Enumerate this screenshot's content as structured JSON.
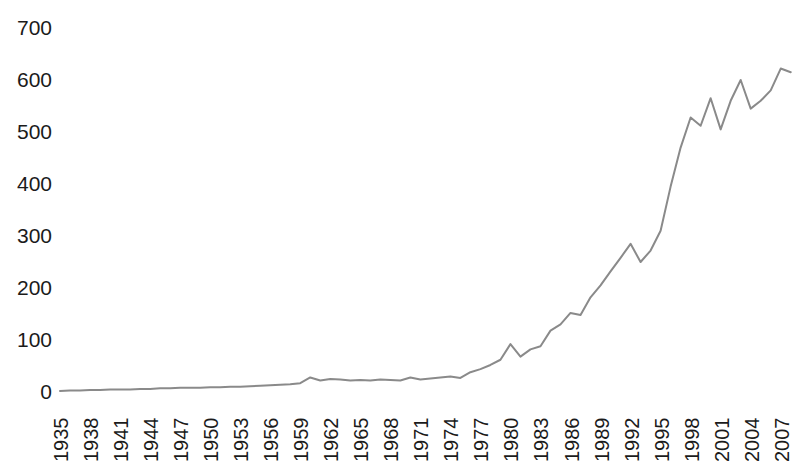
{
  "chart_data": {
    "type": "line",
    "title": "",
    "subtitle": "",
    "xlabel": "",
    "ylabel": "",
    "grid": false,
    "legend": null,
    "line_color": "#8a8a8a",
    "background_color": "#ffffff",
    "text_color": "#1b1b1b",
    "ylim": [
      0,
      700
    ],
    "yticks": [
      0,
      100,
      200,
      300,
      400,
      500,
      600,
      700
    ],
    "ytick_labels": [
      "0",
      "100",
      "200",
      "300",
      "400",
      "500",
      "600",
      "700"
    ],
    "xlim": [
      1935,
      2008
    ],
    "xtick_step": 3,
    "xtick_labels": [
      "1935",
      "1938",
      "1941",
      "1944",
      "1947",
      "1950",
      "1953",
      "1956",
      "1959",
      "1962",
      "1965",
      "1968",
      "1971",
      "1974",
      "1977",
      "1980",
      "1983",
      "1986",
      "1989",
      "1992",
      "1995",
      "1998",
      "2001",
      "2004",
      "2007"
    ],
    "x": [
      1935,
      1936,
      1937,
      1938,
      1939,
      1940,
      1941,
      1942,
      1943,
      1944,
      1945,
      1946,
      1947,
      1948,
      1949,
      1950,
      1951,
      1952,
      1953,
      1954,
      1955,
      1956,
      1957,
      1958,
      1959,
      1960,
      1961,
      1962,
      1963,
      1964,
      1965,
      1966,
      1967,
      1968,
      1969,
      1970,
      1971,
      1972,
      1973,
      1974,
      1975,
      1976,
      1977,
      1978,
      1979,
      1980,
      1981,
      1982,
      1983,
      1984,
      1985,
      1986,
      1987,
      1988,
      1989,
      1990,
      1991,
      1992,
      1993,
      1994,
      1995,
      1996,
      1997,
      1998,
      1999,
      2000,
      2001,
      2002,
      2003,
      2004,
      2005,
      2006,
      2007,
      2008
    ],
    "values": [
      2,
      3,
      3,
      4,
      4,
      5,
      5,
      5,
      6,
      6,
      7,
      7,
      8,
      8,
      8,
      9,
      9,
      10,
      10,
      11,
      12,
      13,
      14,
      15,
      17,
      28,
      22,
      25,
      24,
      22,
      23,
      22,
      24,
      23,
      22,
      28,
      24,
      26,
      28,
      30,
      27,
      38,
      44,
      52,
      62,
      92,
      68,
      82,
      88,
      118,
      130,
      152,
      148,
      182,
      205,
      232,
      258,
      285,
      250,
      272,
      310,
      395,
      470,
      528,
      512,
      565,
      505,
      560,
      600,
      545,
      560,
      580,
      622,
      615
    ],
    "series": [
      {
        "name": "series-1",
        "values": [
          2,
          3,
          3,
          4,
          4,
          5,
          5,
          5,
          6,
          6,
          7,
          7,
          8,
          8,
          8,
          9,
          9,
          10,
          10,
          11,
          12,
          13,
          14,
          15,
          17,
          28,
          22,
          25,
          24,
          22,
          23,
          22,
          24,
          23,
          22,
          28,
          24,
          26,
          28,
          30,
          27,
          38,
          44,
          52,
          62,
          92,
          68,
          82,
          88,
          118,
          130,
          152,
          148,
          182,
          205,
          232,
          258,
          285,
          250,
          272,
          310,
          395,
          470,
          528,
          512,
          565,
          505,
          560,
          600,
          545,
          560,
          580,
          622,
          615
        ]
      }
    ]
  }
}
